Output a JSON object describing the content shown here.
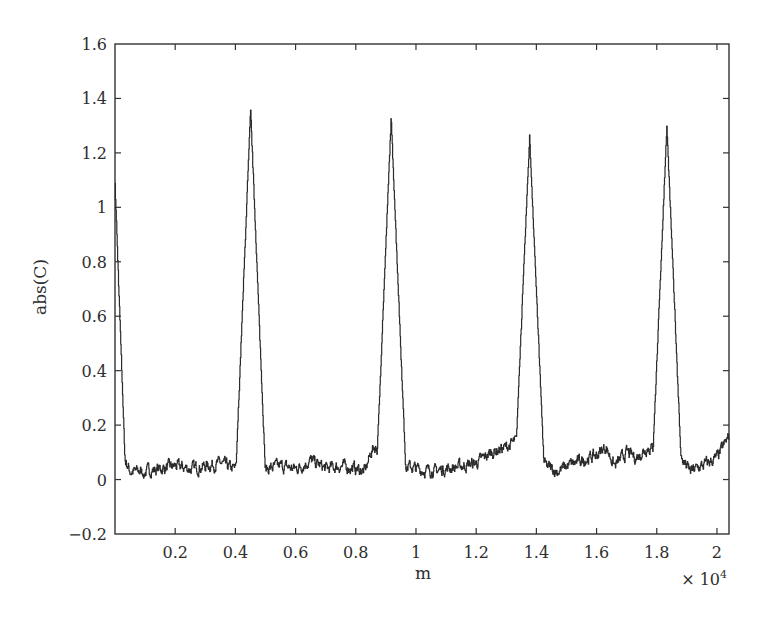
{
  "chart_data": {
    "type": "line",
    "title": "",
    "xlabel": "m",
    "ylabel": "abs(C)",
    "x_multiplier_label": "× 10",
    "x_multiplier_exponent": "4",
    "xlim": [
      0,
      2.04
    ],
    "ylim": [
      -0.2,
      1.6
    ],
    "x_ticks": [
      0.2,
      0.4,
      0.6,
      0.8,
      1,
      1.2,
      1.4,
      1.6,
      1.8,
      2
    ],
    "x_tick_labels": [
      "0.2",
      "0.4",
      "0.6",
      "0.8",
      "1",
      "1.2",
      "1.4",
      "1.6",
      "1.8",
      "2"
    ],
    "y_ticks": [
      -0.2,
      0,
      0.2,
      0.4,
      0.6,
      0.8,
      1,
      1.2,
      1.4,
      1.6
    ],
    "y_tick_labels": [
      "−0.2",
      "0",
      "0.2",
      "0.4",
      "0.6",
      "0.8",
      "1",
      "1.2",
      "1.4",
      "1.6"
    ],
    "grid": false,
    "legend": null,
    "line_color": "#2a2a2a",
    "series": [
      {
        "name": "abs(C)",
        "description": "Correlation magnitude vs lag m (×10^4): initial peak ~1.08 at m=0 decaying by m≈0.03, then four periodic peaks on a noisy baseline ~0.02–0.15",
        "peaks": [
          {
            "x": 0.0,
            "y": 1.08,
            "half_width": 0.035
          },
          {
            "x": 0.45,
            "y": 1.36,
            "half_width": 0.05
          },
          {
            "x": 0.917,
            "y": 1.33,
            "half_width": 0.05
          },
          {
            "x": 1.377,
            "y": 1.26,
            "half_width": 0.05
          },
          {
            "x": 1.833,
            "y": 1.3,
            "half_width": 0.05
          }
        ],
        "baseline_points": [
          [
            0.03,
            0.08
          ],
          [
            0.05,
            0.03
          ],
          [
            0.1,
            0.03
          ],
          [
            0.15,
            0.04
          ],
          [
            0.2,
            0.05
          ],
          [
            0.25,
            0.04
          ],
          [
            0.3,
            0.05
          ],
          [
            0.35,
            0.06
          ],
          [
            0.39,
            0.04
          ],
          [
            0.5,
            0.04
          ],
          [
            0.55,
            0.05
          ],
          [
            0.6,
            0.04
          ],
          [
            0.65,
            0.07
          ],
          [
            0.7,
            0.04
          ],
          [
            0.75,
            0.05
          ],
          [
            0.8,
            0.04
          ],
          [
            0.83,
            0.03
          ],
          [
            0.85,
            0.1
          ],
          [
            0.86,
            0.12
          ],
          [
            0.97,
            0.05
          ],
          [
            1.0,
            0.04
          ],
          [
            1.05,
            0.03
          ],
          [
            1.1,
            0.04
          ],
          [
            1.15,
            0.05
          ],
          [
            1.2,
            0.06
          ],
          [
            1.25,
            0.1
          ],
          [
            1.3,
            0.12
          ],
          [
            1.33,
            0.14
          ],
          [
            1.43,
            0.05
          ],
          [
            1.47,
            0.03
          ],
          [
            1.5,
            0.05
          ],
          [
            1.55,
            0.07
          ],
          [
            1.6,
            0.09
          ],
          [
            1.63,
            0.12
          ],
          [
            1.66,
            0.05
          ],
          [
            1.7,
            0.1
          ],
          [
            1.73,
            0.08
          ],
          [
            1.77,
            0.12
          ],
          [
            1.88,
            0.08
          ],
          [
            1.91,
            0.03
          ],
          [
            1.95,
            0.05
          ],
          [
            2.0,
            0.08
          ],
          [
            2.04,
            0.16
          ]
        ]
      }
    ]
  }
}
